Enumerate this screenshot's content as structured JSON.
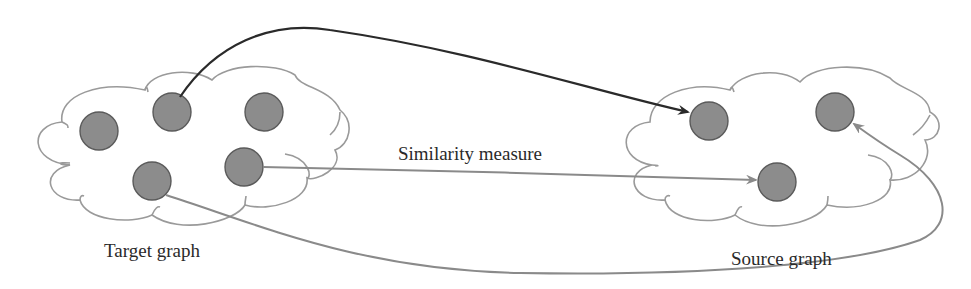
{
  "diagram": {
    "type": "graph-mapping",
    "labels": {
      "target": "Target graph",
      "source": "Source graph",
      "edge_middle": "Similarity measure"
    },
    "colors": {
      "node_fill": "#8c8c8c",
      "node_stroke": "#5a5a5a",
      "cloud_stroke": "#9a9a9a",
      "arrow_dark": "#2a2a2a",
      "arrow_gray": "#8a8a8a"
    },
    "target_graph": {
      "nodes": [
        {
          "id": "t1",
          "cx": 99,
          "cy": 131
        },
        {
          "id": "t2",
          "cx": 172,
          "cy": 112
        },
        {
          "id": "t3",
          "cx": 264,
          "cy": 112
        },
        {
          "id": "t4",
          "cx": 152,
          "cy": 181
        },
        {
          "id": "t5",
          "cx": 244,
          "cy": 167
        }
      ]
    },
    "source_graph": {
      "nodes": [
        {
          "id": "s1",
          "cx": 709,
          "cy": 121
        },
        {
          "id": "s2",
          "cx": 835,
          "cy": 112
        },
        {
          "id": "s3",
          "cx": 777,
          "cy": 182
        }
      ]
    },
    "edges": [
      {
        "from": "t2",
        "to": "s1",
        "style": "dark"
      },
      {
        "from": "t5",
        "to": "s3",
        "style": "gray",
        "label": "Similarity measure"
      },
      {
        "from": "t4",
        "to": "s2",
        "style": "gray"
      }
    ]
  }
}
